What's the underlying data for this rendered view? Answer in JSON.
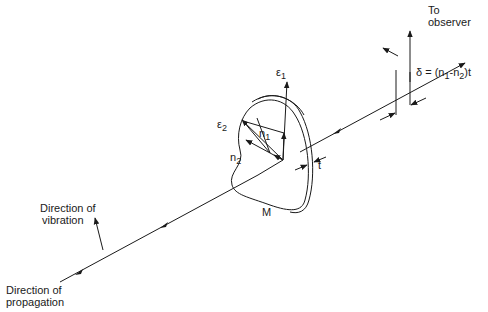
{
  "figure": {
    "colors": {
      "ink": "#1a1a1a",
      "background": "#ffffff"
    },
    "labels": {
      "to_observer_line1": "To",
      "to_observer_line2": "observer",
      "retardation": "δ = (n₁-n₂)t",
      "retardation_parts": {
        "delta": "δ = (n",
        "sub1": "1",
        "mid": "-n",
        "sub2": "2",
        "end": ")t"
      },
      "epsilon1": {
        "base": "ε",
        "sub": "1"
      },
      "epsilon2": {
        "base": "ε",
        "sub": "2"
      },
      "n1": {
        "base": "n",
        "sub": "1"
      },
      "n2": {
        "base": "n",
        "sub": "2"
      },
      "thickness": "t",
      "material": "M",
      "vibration_line1": "Direction of",
      "vibration_line2": "vibration",
      "propagation_line1": "Direction of",
      "propagation_line2": "propagation"
    }
  }
}
